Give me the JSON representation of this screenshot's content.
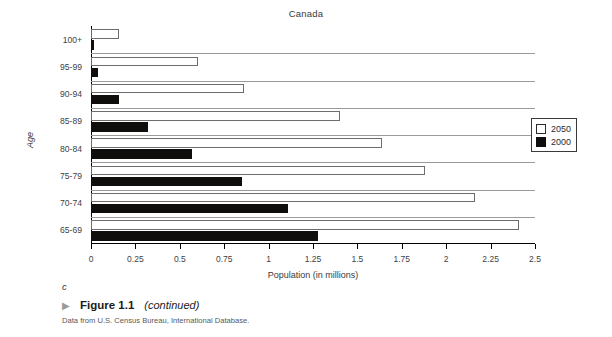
{
  "chart_data": {
    "type": "bar",
    "orientation": "horizontal",
    "title": "Canada",
    "xlabel": "Population (in millions)",
    "ylabel": "Age",
    "xlim": [
      0,
      2.5
    ],
    "xticks": [
      "0",
      "0.25",
      "0.5",
      "0.75",
      "1",
      "1.25",
      "1.5",
      "1.75",
      "2",
      "2.25",
      "2.5"
    ],
    "xtick_values": [
      0,
      0.25,
      0.5,
      0.75,
      1,
      1.25,
      1.5,
      1.75,
      2,
      2.25,
      2.5
    ],
    "grid": "horizontal",
    "legend_position": "right",
    "categories": [
      "100+",
      "95-99",
      "90-94",
      "85-89",
      "80-84",
      "75-79",
      "70-74",
      "65-69"
    ],
    "series": [
      {
        "name": "2050",
        "color": "#ffffff",
        "values": [
          0.16,
          0.6,
          0.86,
          1.4,
          1.64,
          1.88,
          2.16,
          2.41
        ]
      },
      {
        "name": "2000",
        "color": "#100d0d",
        "values": [
          0.015,
          0.04,
          0.16,
          0.32,
          0.57,
          0.85,
          1.11,
          1.28
        ]
      }
    ]
  },
  "legend": {
    "items": [
      {
        "label": "2050",
        "swatch": "hollow-square"
      },
      {
        "label": "2000",
        "swatch": "filled-square"
      }
    ]
  },
  "figure": {
    "subfigure_marker": "c",
    "arrow_glyph": "▶",
    "number": "Figure 1.1",
    "continued": "(continued)",
    "source": "Data from U.S. Census Bureau, International Database."
  }
}
